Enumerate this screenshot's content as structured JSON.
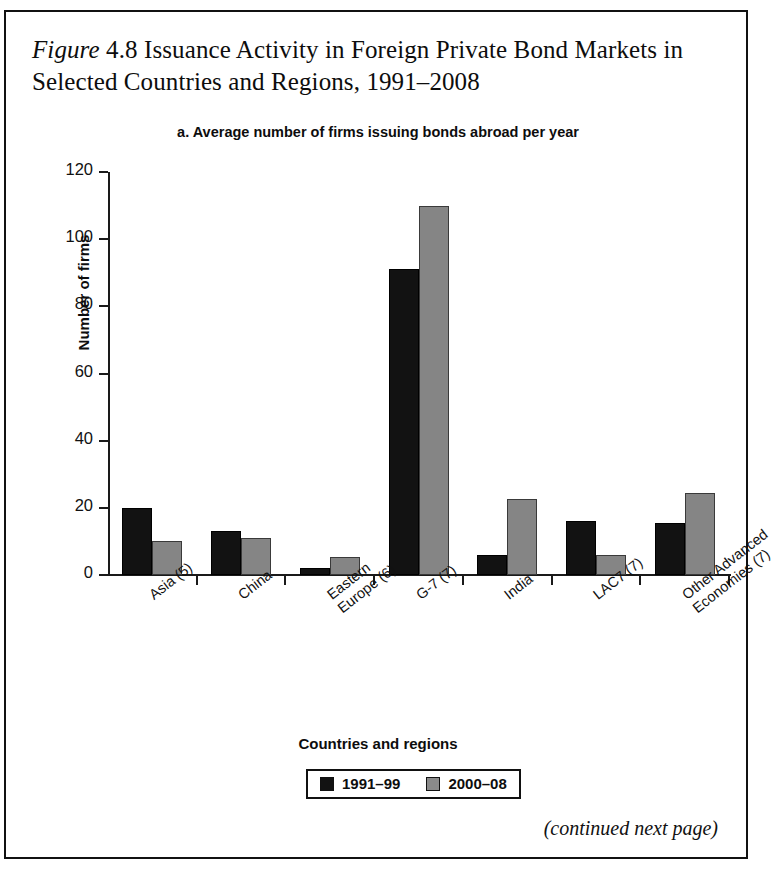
{
  "figure": {
    "label_italic": "Figure",
    "number": "4.8",
    "title_rest": "Issuance Activity in Foreign Private Bond Markets in Selected Countries and Regions, 1991–2008",
    "continued_note": "(continued next page)"
  },
  "chart_data": {
    "type": "bar",
    "title": "a. Average number of firms issuing bonds abroad per year",
    "xlabel": "Countries and regions",
    "ylabel": "Number of firms",
    "ylim": [
      0,
      120
    ],
    "yticks": [
      0,
      20,
      40,
      60,
      80,
      100,
      120
    ],
    "ytick_labels": [
      "0",
      "20",
      "40",
      "60",
      "80",
      "100",
      "120"
    ],
    "grid": false,
    "legend_position": "bottom",
    "categories": [
      "Asia (5)",
      "China",
      "Eastern\nEurope (6)",
      "G-7 (7)",
      "India",
      "LAC7 (7)",
      "Other Advanced\nEconomies (7)"
    ],
    "series": [
      {
        "name": "1991–99",
        "color": "#121212",
        "values": [
          20,
          13,
          2,
          91,
          6,
          16,
          15.5
        ]
      },
      {
        "name": "2000–08",
        "color": "#858585",
        "values": [
          10,
          11,
          5.5,
          110,
          22.5,
          6,
          24.5
        ]
      }
    ]
  }
}
